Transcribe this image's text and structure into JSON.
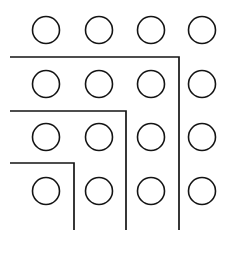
{
  "figure": {
    "canvas": {
      "width": 232,
      "height": 253,
      "background_color": "#ffffff"
    },
    "style": {
      "stroke_color": "#141414",
      "circle_stroke_width": 1.6,
      "bracket_stroke_width": 1.7,
      "circle_fill": "none"
    },
    "grid": {
      "rows": 4,
      "columns": 4,
      "total_circles": 16,
      "circle_radius": 13.5,
      "row_centers_y": [
        30,
        84,
        137,
        191
      ],
      "column_centers_x": [
        46,
        99,
        151,
        202
      ],
      "circles": [
        {
          "row": 1,
          "col": 1,
          "cx": 46,
          "cy": 30,
          "r": 13.5
        },
        {
          "row": 1,
          "col": 2,
          "cx": 99,
          "cy": 30,
          "r": 13.5
        },
        {
          "row": 1,
          "col": 3,
          "cx": 151,
          "cy": 30,
          "r": 13.5
        },
        {
          "row": 1,
          "col": 4,
          "cx": 202,
          "cy": 30,
          "r": 13.5
        },
        {
          "row": 2,
          "col": 1,
          "cx": 46,
          "cy": 84,
          "r": 13.5
        },
        {
          "row": 2,
          "col": 2,
          "cx": 99,
          "cy": 84,
          "r": 13.5
        },
        {
          "row": 2,
          "col": 3,
          "cx": 151,
          "cy": 84,
          "r": 13.5
        },
        {
          "row": 2,
          "col": 4,
          "cx": 202,
          "cy": 84,
          "r": 13.5
        },
        {
          "row": 3,
          "col": 1,
          "cx": 46,
          "cy": 137,
          "r": 13.5
        },
        {
          "row": 3,
          "col": 2,
          "cx": 99,
          "cy": 137,
          "r": 13.5
        },
        {
          "row": 3,
          "col": 3,
          "cx": 151,
          "cy": 137,
          "r": 13.5
        },
        {
          "row": 3,
          "col": 4,
          "cx": 202,
          "cy": 137,
          "r": 13.5
        },
        {
          "row": 4,
          "col": 1,
          "cx": 46,
          "cy": 191,
          "r": 13.5
        },
        {
          "row": 4,
          "col": 2,
          "cx": 99,
          "cy": 191,
          "r": 13.5
        },
        {
          "row": 4,
          "col": 3,
          "cx": 151,
          "cy": 191,
          "r": 13.5
        },
        {
          "row": 4,
          "col": 4,
          "cx": 202,
          "cy": 191,
          "r": 13.5
        }
      ]
    },
    "brackets": [
      {
        "index": 1,
        "name": "outer-bracket",
        "start_x": 10,
        "horizontal_y": 57,
        "corner_x": 179,
        "end_y": 230,
        "path": "M 10 57 L 179 57 L 179 230"
      },
      {
        "index": 2,
        "name": "middle-bracket",
        "start_x": 10,
        "horizontal_y": 111,
        "corner_x": 126,
        "end_y": 230,
        "path": "M 10 111 L 126 111 L 126 230"
      },
      {
        "index": 3,
        "name": "inner-bracket",
        "start_x": 10,
        "horizontal_y": 163,
        "corner_x": 74,
        "end_y": 230,
        "path": "M 10 163 L 74 163 L 74 230"
      }
    ]
  }
}
